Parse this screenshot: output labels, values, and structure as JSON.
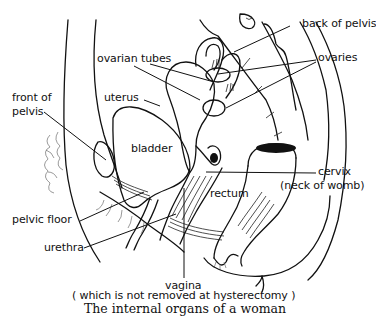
{
  "figure": {
    "caption": "The internal organs of a woman",
    "labels": {
      "back_of_pelvis": "back of pelvis",
      "ovarian_tubes": "ovarian tubes",
      "ovaries": "ovaries",
      "front_of_pelvis_1": "front of",
      "front_of_pelvis_2": "pelvis",
      "uterus": "uterus",
      "bladder": "bladder",
      "cervix": "cervix",
      "cervix_note": "(neck of womb)",
      "rectum": "rectum",
      "pelvic_floor": "pelvic floor",
      "urethra": "urethra",
      "vagina": "vagina",
      "vagina_note": "( which is not removed at hysterectomy )"
    },
    "colors": {
      "ink": "#111111",
      "background": "#ffffff"
    }
  }
}
